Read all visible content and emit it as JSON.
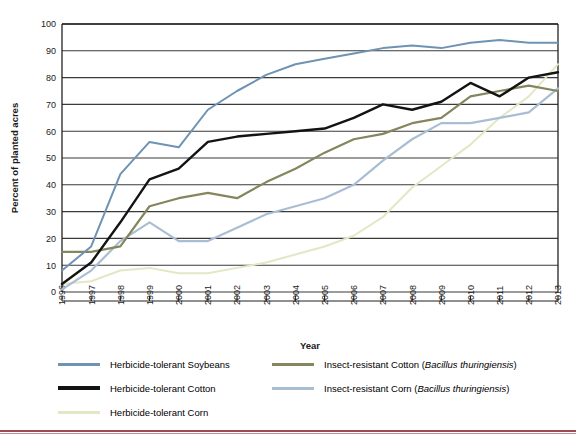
{
  "chart_data": {
    "type": "line",
    "title": "",
    "xlabel": "Year",
    "ylabel": "Percent of planted acres",
    "ylim": [
      0,
      100
    ],
    "ytick_step": 10,
    "grid": true,
    "legend_position": "bottom",
    "categories": [
      "1996",
      "1997",
      "1998",
      "1999",
      "2000",
      "2001",
      "2002",
      "2003",
      "2004",
      "2005",
      "2006",
      "2007",
      "2008",
      "2009",
      "2010",
      "2011",
      "2012",
      "2013"
    ],
    "yticks": [
      "0",
      "10",
      "20",
      "30",
      "40",
      "50",
      "60",
      "70",
      "80",
      "90",
      "100"
    ],
    "series": [
      {
        "name": "Herbicide-tolerant Soybeans",
        "color": "#6e93b3",
        "width": 2.0,
        "values": [
          8,
          17,
          44,
          56,
          54,
          68,
          75,
          81,
          85,
          87,
          89,
          91,
          92,
          91,
          93,
          94,
          93,
          93
        ]
      },
      {
        "name": "Herbicide-tolerant Cotton",
        "color": "#131313",
        "width": 2.4,
        "values": [
          3,
          11,
          26,
          42,
          46,
          56,
          58,
          59,
          60,
          61,
          65,
          70,
          68,
          71,
          78,
          73,
          80,
          82
        ]
      },
      {
        "name": "Herbicide-tolerant Corn",
        "color": "#e4e7c6",
        "width": 2.0,
        "values": [
          3,
          4,
          8,
          9,
          7,
          7,
          9,
          11,
          14,
          17,
          21,
          28,
          39,
          47,
          55,
          65,
          73,
          85
        ]
      },
      {
        "name": "Insect-resistant Cotton (Bacillus thuringiensis)",
        "color": "#85855e",
        "width": 2.2,
        "values": [
          15,
          15,
          17,
          32,
          35,
          37,
          35,
          41,
          46,
          52,
          57,
          59,
          63,
          65,
          73,
          75,
          77,
          75
        ]
      },
      {
        "name": "Insect-resistant Corn (Bacillus thuringiensis)",
        "color": "#a9bed4",
        "width": 2.2,
        "values": [
          1,
          8,
          19,
          26,
          19,
          19,
          24,
          29,
          32,
          35,
          40,
          49,
          57,
          63,
          63,
          65,
          67,
          76
        ]
      }
    ]
  },
  "axis": {
    "x_title": "Year",
    "y_title": "Percent of planted acres"
  },
  "legend": {
    "left_column": [
      {
        "label": "Herbicide-tolerant Soybeans",
        "color": "#6e93b3"
      },
      {
        "label": "Herbicide-tolerant Cotton",
        "color": "#131313"
      },
      {
        "label": "Herbicide-tolerant Corn",
        "color": "#e4e7c6"
      }
    ],
    "right_column": [
      {
        "label_plain": "Insect-resistant Cotton (",
        "label_italic": "Bacillus thuringiensis",
        "label_tail": ")",
        "color": "#85855e"
      },
      {
        "label_plain": "Insect-resistant Corn (",
        "label_italic": "Bacillus thuringiensis",
        "label_tail": ")",
        "color": "#a9bed4"
      }
    ]
  },
  "colors": {
    "grid": "#3a3a3a",
    "axis": "#222222",
    "rule": "#9d4a55",
    "background": "#ffffff"
  }
}
